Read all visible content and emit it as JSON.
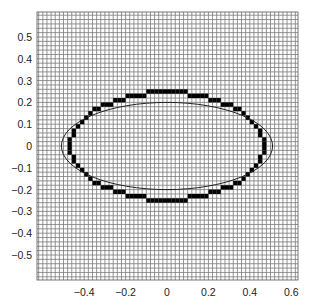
{
  "chart_data": {
    "type": "scatter",
    "title": "",
    "xlabel": "",
    "ylabel": "",
    "xlim": [
      -0.628,
      0.633
    ],
    "ylim": [
      -0.615,
      0.615
    ],
    "grid": {
      "on": true,
      "spacing": 0.02,
      "color": "#7a7a7a"
    },
    "x_ticks": [
      {
        "value": -0.4,
        "label": "−0.4"
      },
      {
        "value": -0.2,
        "label": "−0.2"
      },
      {
        "value": 0,
        "label": "0"
      },
      {
        "value": 0.2,
        "label": "0.2"
      },
      {
        "value": 0.4,
        "label": "0.4"
      },
      {
        "value": 0.6,
        "label": "0.6"
      }
    ],
    "y_ticks": [
      {
        "value": 0.5,
        "label": "0.5"
      },
      {
        "value": 0.4,
        "label": "0.4"
      },
      {
        "value": 0.3,
        "label": "0.3"
      },
      {
        "value": 0.2,
        "label": "0.2"
      },
      {
        "value": 0.1,
        "label": "0.1"
      },
      {
        "value": 0,
        "label": "0"
      },
      {
        "value": -0.1,
        "label": "−0.1"
      },
      {
        "value": -0.2,
        "label": "−0.2"
      },
      {
        "value": -0.3,
        "label": "−0.3"
      },
      {
        "value": -0.4,
        "label": "−0.4"
      },
      {
        "value": -0.5,
        "label": "−0.5"
      }
    ],
    "series": [
      {
        "name": "smooth-ellipse",
        "kind": "ellipse-curve",
        "center": [
          0,
          0
        ],
        "semi_axes": [
          0.51,
          0.2
        ],
        "color": "#222222",
        "line_width": 1
      },
      {
        "name": "pixelated-ellipse",
        "kind": "rasterized-ellipse-boundary",
        "center": [
          0,
          0
        ],
        "semi_axes": [
          0.475,
          0.255
        ],
        "cell_size": 0.02,
        "color": "#000000"
      }
    ]
  },
  "layout": {
    "plot_px": {
      "left": 37,
      "top": 12,
      "right": 298,
      "bottom": 280
    },
    "origin_px": [
      167,
      146
    ],
    "px_per_unit": [
      207,
      218
    ]
  }
}
